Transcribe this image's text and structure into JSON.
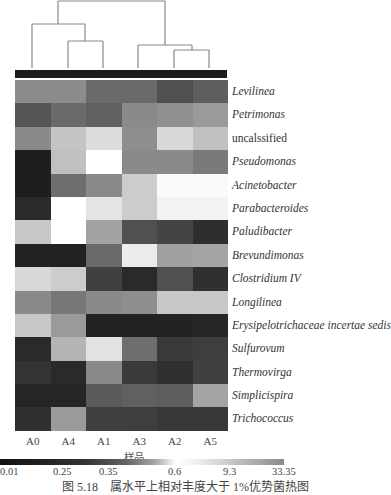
{
  "chart_data": {
    "type": "heatmap",
    "title": "",
    "xlabel": "样品",
    "ylabel": "",
    "columns": [
      "A0",
      "A4",
      "A1",
      "A3",
      "A2",
      "A5"
    ],
    "rows": [
      {
        "label": "Levilinea",
        "italic": true
      },
      {
        "label": "Petrimonas",
        "italic": true
      },
      {
        "label": "uncalssified",
        "italic": false
      },
      {
        "label": "Pseudomonas",
        "italic": true
      },
      {
        "label": "Acinetobacter",
        "italic": true
      },
      {
        "label": "Parabacteroides",
        "italic": true
      },
      {
        "label": "Paludibacter",
        "italic": true
      },
      {
        "label": "Brevundimonas",
        "italic": true
      },
      {
        "label": "Clostridium IV",
        "italic": true
      },
      {
        "label": "Longilinea",
        "italic": true
      },
      {
        "label": "Erysipelotrichaceae incertae sedis",
        "italic": true
      },
      {
        "label": "Sulfurovum",
        "italic": true
      },
      {
        "label": "Thermovirga",
        "italic": true
      },
      {
        "label": "Simplicispira",
        "italic": true
      },
      {
        "label": "Trichococcus",
        "italic": true
      }
    ],
    "cell_colors": [
      [
        "#8c8c8c",
        "#8c8c8c",
        "#6a6a6a",
        "#6a6a6a",
        "#505050",
        "#5e5e5e"
      ],
      [
        "#555555",
        "#6a6a6a",
        "#606060",
        "#8a8a8a",
        "#909090",
        "#9a9a9a"
      ],
      [
        "#8a8a8a",
        "#c4c4c4",
        "#dcdcdc",
        "#8e8e8e",
        "#d8d8d8",
        "#c0c0c0"
      ],
      [
        "#1e1e1e",
        "#c0c0c0",
        "#ffffff",
        "#8a8a8a",
        "#8a8a8a",
        "#7a7a7a"
      ],
      [
        "#1e1e1e",
        "#6e6e6e",
        "#8a8a8a",
        "#cccccc",
        "#fafafa",
        "#fafafa"
      ],
      [
        "#2a2a2a",
        "#ffffff",
        "#e4e4e4",
        "#cccccc",
        "#f2f2f2",
        "#f2f2f2"
      ],
      [
        "#c8c8c8",
        "#ffffff",
        "#a2a2a2",
        "#505050",
        "#444444",
        "#2e2e2e"
      ],
      [
        "#222222",
        "#222222",
        "#6a6a6a",
        "#ececec",
        "#a0a0a0",
        "#a4a4a4"
      ],
      [
        "#d8d8d8",
        "#cccccc",
        "#404040",
        "#2a2a2a",
        "#505050",
        "#303030"
      ],
      [
        "#8a8a8a",
        "#777777",
        "#8a8a8a",
        "#8e8e8e",
        "#c8c8c8",
        "#c8c8c8"
      ],
      [
        "#c8c8c8",
        "#9a9a9a",
        "#222222",
        "#222222",
        "#222222",
        "#262626"
      ],
      [
        "#2a2a2a",
        "#b4b4b4",
        "#e2e2e2",
        "#6e6e6e",
        "#3a3a3a",
        "#3e3e3e"
      ],
      [
        "#333333",
        "#2a2a2a",
        "#8a8a8a",
        "#3a3a3a",
        "#303030",
        "#404040"
      ],
      [
        "#262626",
        "#262626",
        "#5a5a5a",
        "#606060",
        "#5e5e5e",
        "#a4a4a4"
      ],
      [
        "#303030",
        "#9a9a9a",
        "#404040",
        "#3e3e3e",
        "#383838",
        "#383838"
      ]
    ],
    "colorbar": {
      "ticks": [
        "0.01",
        "0.25",
        "0.35",
        "0.6",
        "9.3",
        "33.35"
      ],
      "tick_positions_px": [
        0,
        53,
        99,
        168,
        223,
        272
      ]
    },
    "dendrogram": {
      "clusters": "((A0,(A4,A1)),(A3,(A2,A5)))"
    },
    "caption": "图 5.18　属水平上相对丰度大于 1%优势菌热图"
  }
}
